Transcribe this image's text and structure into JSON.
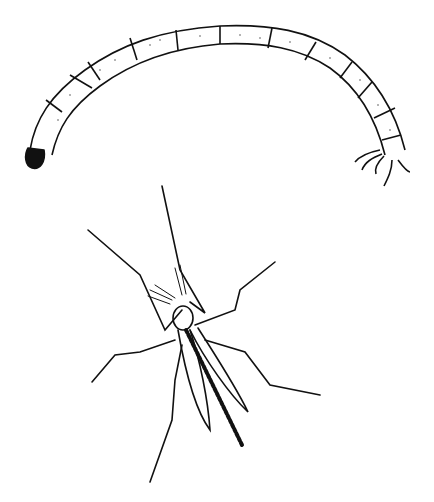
{
  "illustration": {
    "background": "#ffffff",
    "ink": "#111111",
    "subjects": [
      {
        "name": "larva",
        "segments": 12
      },
      {
        "name": "adult-midge",
        "legs": 6
      }
    ]
  }
}
